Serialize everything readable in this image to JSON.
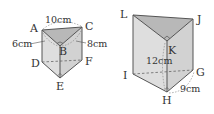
{
  "colors": {
    "face_light": "#e4e4e4",
    "face_mid": "#d4d4d4",
    "face_top": "#bdbdbd",
    "edge": "#555555",
    "hidden_edge": "#777777"
  },
  "prism_left": {
    "vertices": {
      "A": "A",
      "B": "B",
      "C": "C",
      "D": "D",
      "E": "E",
      "F": "F"
    },
    "dimensions": {
      "AC": "10cm",
      "AB": "6cm",
      "BC": "8cm"
    }
  },
  "prism_right": {
    "vertices": {
      "L": "L",
      "K": "K",
      "J": "J",
      "I": "I",
      "H": "H",
      "G": "G"
    },
    "dimensions": {
      "height": "12cm",
      "HG": "9cm"
    }
  }
}
